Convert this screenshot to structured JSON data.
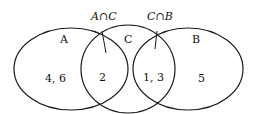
{
  "diagram": {
    "type": "venn",
    "sets": [
      {
        "name": "A",
        "label": "A"
      },
      {
        "name": "C",
        "label": "C"
      },
      {
        "name": "B",
        "label": "B"
      }
    ],
    "regions": {
      "a_only": "4, 6",
      "a_and_c": "2",
      "c_and_b": "1, 3",
      "b_only": "5"
    },
    "callouts": {
      "a_intersect_c": "A∩C",
      "c_intersect_b": "C∩B"
    },
    "colors": {
      "stroke": "#1a1a1a",
      "background": "#ffffff"
    }
  }
}
